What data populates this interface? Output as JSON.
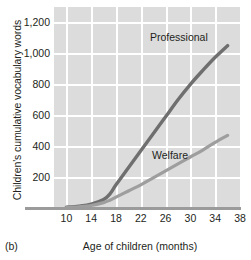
{
  "caption": "(b)",
  "chart_data": {
    "type": "line",
    "title": "",
    "xlabel": "Age of children (months)",
    "ylabel": "Children's cumulative vocabulary words",
    "xlim": [
      8,
      38
    ],
    "ylim": [
      0,
      1300
    ],
    "xticks": [
      10,
      14,
      18,
      22,
      26,
      30,
      34,
      38
    ],
    "xtick_labels": [
      "10",
      "14",
      "18",
      "22",
      "26",
      "30",
      "34",
      "38"
    ],
    "yticks": [
      200,
      400,
      600,
      800,
      1000,
      1200
    ],
    "ytick_labels": [
      "200",
      "400",
      "600",
      "800",
      "1,000",
      "1,200"
    ],
    "grid": true,
    "grid_color": "#ffffff",
    "plot_background": "#dcdcdc",
    "legend_position": "inline-annotation",
    "series": [
      {
        "name": "Professional",
        "label": "Professional",
        "color": "#6f6f6f",
        "x": [
          10,
          12,
          14,
          16,
          17,
          18,
          20,
          22,
          24,
          26,
          28,
          30,
          32,
          34,
          36
        ],
        "values": [
          5,
          12,
          25,
          55,
          90,
          150,
          260,
          370,
          480,
          590,
          700,
          800,
          890,
          975,
          1050
        ]
      },
      {
        "name": "Welfare",
        "label": "Welfare",
        "color": "#9e9e9e",
        "x": [
          10,
          12,
          14,
          16,
          17,
          18,
          20,
          22,
          24,
          26,
          28,
          30,
          32,
          34,
          36
        ],
        "values": [
          3,
          8,
          16,
          35,
          50,
          70,
          110,
          150,
          195,
          240,
          285,
          330,
          375,
          425,
          470
        ]
      }
    ]
  }
}
